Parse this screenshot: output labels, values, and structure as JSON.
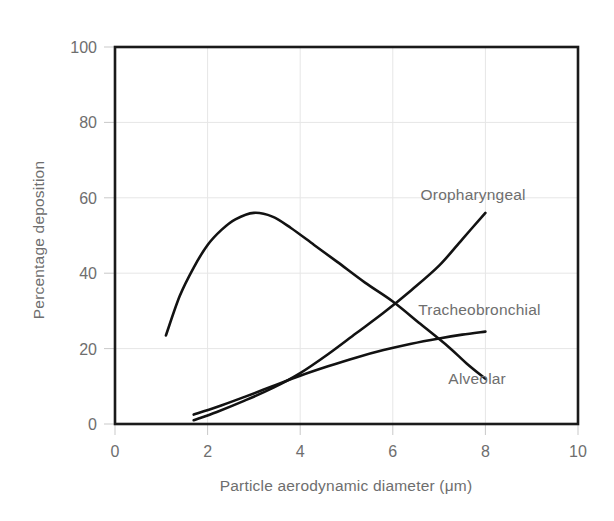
{
  "chart_data": {
    "type": "line",
    "title": "",
    "xlabel": "Particle aerodynamic diameter (μm)",
    "ylabel": "Percentage deposition",
    "xlim": [
      0,
      10
    ],
    "ylim": [
      0,
      100
    ],
    "xticks": [
      "0",
      "2",
      "4",
      "6",
      "8",
      "10"
    ],
    "xtick_values": [
      0,
      2,
      4,
      6,
      8,
      10
    ],
    "yticks": [
      "0",
      "20",
      "40",
      "60",
      "80",
      "100"
    ],
    "ytick_values": [
      0,
      20,
      40,
      60,
      80,
      100
    ],
    "grid": true,
    "grid_color": "#e6e6e6",
    "legend_position": "inline-labels",
    "line_color": "#121212",
    "label_color": "#6e6e6e",
    "series": [
      {
        "name": "Alveolar",
        "label_text": "Alveolar",
        "label_x": 7.2,
        "label_y": 10.5,
        "points": [
          [
            1.1,
            23.5
          ],
          [
            1.4,
            34.0
          ],
          [
            1.7,
            41.5
          ],
          [
            2.0,
            47.5
          ],
          [
            2.3,
            51.5
          ],
          [
            2.6,
            54.3
          ],
          [
            3.0,
            56.0
          ],
          [
            3.4,
            55.0
          ],
          [
            3.8,
            52.0
          ],
          [
            4.3,
            47.5
          ],
          [
            4.8,
            43.0
          ],
          [
            5.4,
            37.5
          ],
          [
            6.0,
            32.5
          ],
          [
            6.6,
            26.5
          ],
          [
            7.2,
            20.5
          ],
          [
            7.6,
            16.0
          ],
          [
            8.0,
            12.0
          ]
        ]
      },
      {
        "name": "Oropharyngeal",
        "label_text": "Oropharyngeal",
        "label_x": 6.6,
        "label_y": 59.5,
        "points": [
          [
            1.7,
            1.0
          ],
          [
            2.2,
            3.2
          ],
          [
            2.8,
            6.2
          ],
          [
            3.4,
            9.5
          ],
          [
            4.0,
            13.5
          ],
          [
            4.6,
            18.5
          ],
          [
            5.2,
            24.0
          ],
          [
            5.8,
            29.5
          ],
          [
            6.4,
            35.5
          ],
          [
            7.0,
            42.0
          ],
          [
            7.5,
            49.0
          ],
          [
            8.0,
            56.0
          ]
        ]
      },
      {
        "name": "Tracheobronchial",
        "label_text": "Tracheobronchial",
        "label_x": 6.55,
        "label_y": 29.0,
        "points": [
          [
            1.7,
            2.5
          ],
          [
            2.2,
            4.5
          ],
          [
            2.8,
            7.2
          ],
          [
            3.4,
            10.0
          ],
          [
            4.0,
            12.8
          ],
          [
            4.6,
            15.3
          ],
          [
            5.2,
            17.6
          ],
          [
            5.8,
            19.6
          ],
          [
            6.4,
            21.3
          ],
          [
            7.0,
            22.7
          ],
          [
            7.5,
            23.7
          ],
          [
            8.0,
            24.5
          ]
        ]
      }
    ]
  }
}
